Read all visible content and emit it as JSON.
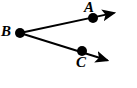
{
  "figure": {
    "type": "geometry-diagram",
    "background_color": "#ffffff",
    "stroke_color": "#000000",
    "width": 137,
    "height": 88,
    "points": [
      {
        "id": "A",
        "label": "A",
        "x": 93,
        "y": 18,
        "radius": 5,
        "label_x": 84,
        "label_y": 0,
        "label_position": "above-left"
      },
      {
        "id": "B",
        "label": "B",
        "x": 20,
        "y": 33,
        "radius": 5,
        "label_x": 1,
        "label_y": 24,
        "label_position": "left"
      },
      {
        "id": "C",
        "label": "C",
        "x": 82,
        "y": 51,
        "radius": 5,
        "label_x": 76,
        "label_y": 55,
        "label_position": "below-left"
      }
    ],
    "rays": [
      {
        "id": "ray-BA",
        "from": "B",
        "through": "A",
        "start_x": 20,
        "start_y": 33,
        "end_x": 123,
        "end_y": 11,
        "arrowhead": "end",
        "stroke_width": 2
      },
      {
        "id": "ray-BC",
        "from": "B",
        "through": "C",
        "start_x": 20,
        "start_y": 33,
        "end_x": 116,
        "end_y": 63,
        "arrowhead": "end",
        "stroke_width": 2
      }
    ]
  }
}
